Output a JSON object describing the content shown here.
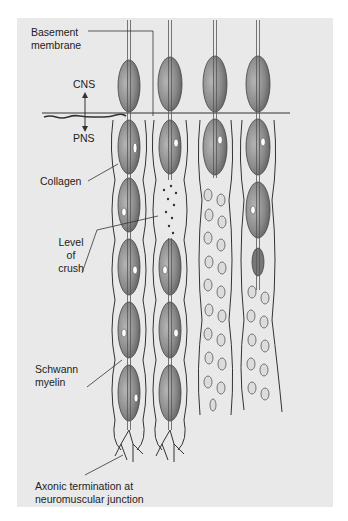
{
  "figure": {
    "labels": {
      "basement_membrane": [
        "Basement",
        "membrane"
      ],
      "cns": "CNS",
      "pns": "PNS",
      "collagen": "Collagen",
      "level_of_crush": [
        "Level",
        "of",
        "crush"
      ],
      "schwann_myelin": [
        "Schwann",
        "myelin"
      ],
      "axonic_termination": [
        "Axonic termination at",
        "neuromuscular junction"
      ]
    },
    "colors": {
      "panel_background": "#e9e9e9",
      "myelin_fill": "#8c8c8c",
      "outline": "#333333"
    }
  }
}
